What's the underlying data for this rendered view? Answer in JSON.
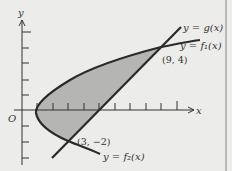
{
  "figure": {
    "axis_labels": {
      "x": "x",
      "y": "y",
      "origin": "O"
    },
    "curves": [
      {
        "name": "g",
        "label": "y = g(x)"
      },
      {
        "name": "f1",
        "label": "y = f₁(x)"
      },
      {
        "name": "f2",
        "label": "y = f₂(x)"
      }
    ],
    "points": [
      {
        "label": "(9, 4)",
        "x": 9,
        "y": 4
      },
      {
        "label": "(3, −2)",
        "x": 3,
        "y": -2
      }
    ],
    "colors": {
      "background": "#ececea",
      "shade": "#b8b8b6",
      "stroke": "#2a2a2a",
      "border": "#888888"
    }
  }
}
